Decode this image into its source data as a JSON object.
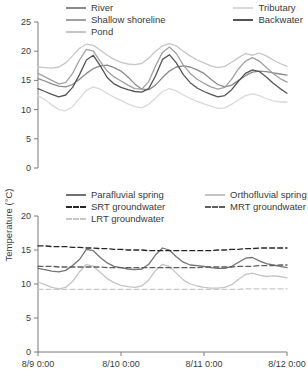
{
  "ylabel": "Temperature (°C)",
  "axis_color": "#7a7a7a",
  "chart_data": [
    {
      "type": "line",
      "panel": "top",
      "ylim": [
        0,
        25
      ],
      "yticks": [
        25,
        20,
        15,
        10,
        5,
        0
      ],
      "x_range_hours": [
        0,
        72
      ],
      "x_tick_hours": [
        0,
        24,
        48,
        72
      ],
      "x_tick_labels": [],
      "x_hours": [
        0,
        2,
        4,
        6,
        8,
        10,
        12,
        14,
        16,
        18,
        20,
        22,
        24,
        26,
        28,
        30,
        32,
        34,
        36,
        38,
        40,
        42,
        44,
        46,
        48,
        50,
        52,
        54,
        56,
        58,
        60,
        62,
        64,
        66,
        68,
        70,
        72
      ],
      "legend_columns": [
        [
          "River",
          "Shallow shoreline",
          "Pond"
        ],
        [
          "Tributary",
          "Backwater"
        ]
      ],
      "series": [
        {
          "name": "River",
          "color": "#8a8a8a",
          "dash": "none",
          "values": [
            15.3,
            14.9,
            14.4,
            14.0,
            13.9,
            14.3,
            15.2,
            16.2,
            17.0,
            17.5,
            17.6,
            17.2,
            16.6,
            15.6,
            14.4,
            13.5,
            13.4,
            14.2,
            15.5,
            16.6,
            17.3,
            17.5,
            17.3,
            16.8,
            16.2,
            15.2,
            14.3,
            13.9,
            14.2,
            15.0,
            15.8,
            16.4,
            16.6,
            16.5,
            16.3,
            16.1,
            15.9
          ]
        },
        {
          "name": "Shallow shoreline",
          "color": "#a0a0a0",
          "dash": "none",
          "values": [
            16.2,
            15.6,
            15.0,
            14.4,
            14.6,
            16.2,
            18.5,
            20.3,
            20.0,
            18.2,
            16.6,
            15.6,
            14.9,
            14.2,
            13.6,
            13.5,
            14.8,
            17.5,
            19.8,
            20.7,
            19.6,
            17.6,
            16.2,
            15.2,
            14.5,
            13.9,
            13.5,
            13.8,
            15.2,
            17.0,
            18.3,
            18.9,
            18.3,
            17.2,
            16.2,
            15.3,
            14.7
          ]
        },
        {
          "name": "Pond",
          "color": "#c6c6c6",
          "dash": "none",
          "values": [
            17.3,
            17.2,
            17.1,
            17.3,
            18.0,
            19.2,
            20.5,
            21.2,
            21.0,
            20.2,
            19.3,
            18.6,
            18.1,
            17.8,
            17.7,
            17.9,
            18.8,
            20.0,
            20.9,
            21.3,
            20.9,
            20.0,
            19.2,
            18.5,
            18.0,
            17.5,
            17.2,
            17.4,
            18.1,
            18.9,
            19.6,
            19.3,
            19.7,
            19.2,
            18.5,
            17.9,
            17.4
          ]
        },
        {
          "name": "Tributary",
          "color": "#d9d9d9",
          "dash": "none",
          "values": [
            12.4,
            11.7,
            10.8,
            10.0,
            9.8,
            10.5,
            11.9,
            13.3,
            13.9,
            13.5,
            12.8,
            12.1,
            11.6,
            11.0,
            10.5,
            10.3,
            10.9,
            12.0,
            13.1,
            13.6,
            13.2,
            12.5,
            11.9,
            11.4,
            11.0,
            10.6,
            10.2,
            10.3,
            10.9,
            11.7,
            12.4,
            12.7,
            12.4,
            11.9,
            11.5,
            11.3,
            11.3
          ]
        },
        {
          "name": "Backwater",
          "color": "#555555",
          "dash": "none",
          "values": [
            13.6,
            13.1,
            12.6,
            12.2,
            12.5,
            13.8,
            16.0,
            18.5,
            19.3,
            17.5,
            15.5,
            14.4,
            13.8,
            13.4,
            13.1,
            13.0,
            13.6,
            15.8,
            18.6,
            19.4,
            18.0,
            16.0,
            14.6,
            13.7,
            13.1,
            12.6,
            12.2,
            12.4,
            13.4,
            14.9,
            16.2,
            16.8,
            16.5,
            15.6,
            14.5,
            13.6,
            12.8
          ]
        }
      ]
    },
    {
      "type": "line",
      "panel": "bottom",
      "ylim": [
        0,
        20
      ],
      "yticks": [
        20,
        15,
        10,
        5,
        0
      ],
      "x_range_hours": [
        0,
        72
      ],
      "x_tick_hours": [
        0,
        24,
        48,
        72
      ],
      "x_tick_labels": [
        "8/9 0:00",
        "8/10 0:00",
        "8/11 0:00",
        "8/12 0:00"
      ],
      "x_hours": [
        0,
        2,
        4,
        6,
        8,
        10,
        12,
        14,
        16,
        18,
        20,
        22,
        24,
        26,
        28,
        30,
        32,
        34,
        36,
        38,
        40,
        42,
        44,
        46,
        48,
        50,
        52,
        54,
        56,
        58,
        60,
        62,
        64,
        66,
        68,
        70,
        72
      ],
      "legend_columns": [
        [
          "Parafluvial spring",
          "SRT groundwater",
          "LRT groundwater"
        ],
        [
          "Orthofluvial spring",
          "MRT groundwater"
        ]
      ],
      "series": [
        {
          "name": "Parafluvial spring",
          "color": "#737373",
          "dash": "none",
          "values": [
            12.3,
            12.1,
            11.9,
            11.8,
            12.0,
            12.7,
            13.6,
            15.1,
            14.9,
            13.9,
            13.1,
            12.6,
            12.4,
            12.2,
            12.1,
            12.2,
            12.9,
            14.3,
            15.3,
            15.0,
            14.0,
            13.2,
            12.8,
            12.7,
            12.6,
            12.4,
            12.3,
            12.3,
            12.6,
            13.2,
            13.8,
            13.9,
            13.4,
            13.0,
            12.8,
            12.6,
            12.4
          ]
        },
        {
          "name": "Orthofluvial spring",
          "color": "#c4c4c4",
          "dash": "none",
          "values": [
            10.3,
            9.9,
            9.5,
            9.3,
            9.5,
            10.4,
            11.8,
            12.9,
            12.6,
            11.7,
            10.8,
            10.2,
            9.8,
            9.6,
            9.5,
            9.7,
            10.6,
            12.0,
            12.9,
            12.6,
            11.6,
            10.6,
            10.0,
            9.7,
            9.5,
            9.4,
            9.4,
            9.5,
            9.9,
            10.7,
            11.4,
            11.6,
            11.3,
            11.1,
            11.2,
            11.1,
            10.9
          ]
        },
        {
          "name": "SRT groundwater",
          "color": "#262626",
          "dash": "5,3",
          "values": [
            15.6,
            15.6,
            15.5,
            15.5,
            15.5,
            15.4,
            15.4,
            15.3,
            15.3,
            15.2,
            15.2,
            15.1,
            15.1,
            15.0,
            15.0,
            15.0,
            14.9,
            14.9,
            14.9,
            14.9,
            14.9,
            14.9,
            14.9,
            14.9,
            14.9,
            14.9,
            15.0,
            15.0,
            15.1,
            15.1,
            15.2,
            15.2,
            15.3,
            15.3,
            15.3,
            15.3,
            15.3
          ]
        },
        {
          "name": "MRT groundwater",
          "color": "#5e5e5e",
          "dash": "5,3",
          "values": [
            12.6,
            12.6,
            12.6,
            12.5,
            12.5,
            12.5,
            12.5,
            12.5,
            12.5,
            12.5,
            12.4,
            12.4,
            12.4,
            12.4,
            12.4,
            12.4,
            12.4,
            12.4,
            12.4,
            12.4,
            12.4,
            12.4,
            12.4,
            12.4,
            12.5,
            12.5,
            12.5,
            12.5,
            12.5,
            12.6,
            12.6,
            12.6,
            12.7,
            12.7,
            12.7,
            12.8,
            12.8
          ]
        },
        {
          "name": "LRT groundwater",
          "color": "#c9c9c9",
          "dash": "5,3",
          "values": [
            9.2,
            9.2,
            9.2,
            9.2,
            9.2,
            9.2,
            9.2,
            9.2,
            9.2,
            9.2,
            9.2,
            9.2,
            9.2,
            9.2,
            9.2,
            9.2,
            9.2,
            9.2,
            9.2,
            9.2,
            9.2,
            9.2,
            9.2,
            9.2,
            9.2,
            9.2,
            9.2,
            9.2,
            9.2,
            9.2,
            9.3,
            9.3,
            9.3,
            9.3,
            9.3,
            9.3,
            9.3
          ]
        }
      ]
    }
  ]
}
